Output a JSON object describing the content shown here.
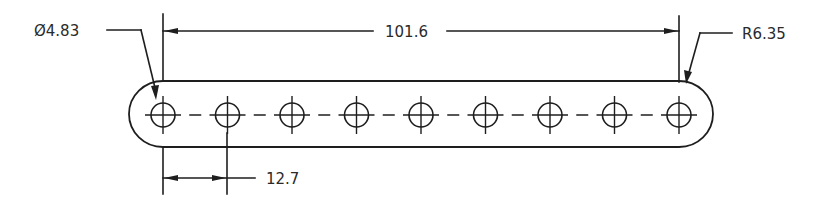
{
  "drawing": {
    "type": "mechanical-part-drawing",
    "part": "flat-link-bar-with-holes",
    "hole_count": 9,
    "stroke_color": "#1e1e1e",
    "background": "#ffffff"
  },
  "dimensions": {
    "hole_diameter": {
      "label": "Ø4.83",
      "symbol": "Ø",
      "value": "4.83"
    },
    "overall_hole_span": {
      "label": "101.6",
      "value": "101.6"
    },
    "end_radius": {
      "label": "R6.35",
      "symbol": "R",
      "value": "6.35"
    },
    "hole_pitch": {
      "label": "12.7",
      "value": "12.7"
    }
  },
  "geometry": {
    "first_hole_x": 163,
    "hole_pitch_px": 64.5,
    "center_y": 115,
    "hole_radius_px": 12,
    "body_top_y": 81,
    "body_bottom_y": 147
  }
}
